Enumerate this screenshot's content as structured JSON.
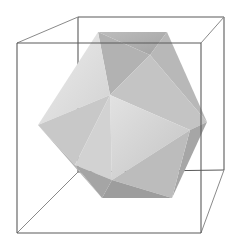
{
  "scene": {
    "title": "",
    "description": "Icosahedron inside a wireframe bounding box",
    "background": "#ffffff",
    "box": {
      "stroke_color": "#5a5a5a",
      "front_face": [
        [
          17,
          43
        ],
        [
          201,
          43
        ],
        [
          201,
          233
        ],
        [
          17,
          233
        ]
      ],
      "back_face_visible_edges": [
        [
          [
            78,
            17
          ],
          [
            224,
            17
          ]
        ],
        [
          [
            224,
            17
          ],
          [
            224,
            170
          ]
        ],
        [
          [
            78,
            17
          ],
          [
            78,
            62
          ]
        ]
      ],
      "connecting_edges": [
        [
          [
            17,
            43
          ],
          [
            78,
            17
          ]
        ],
        [
          [
            201,
            43
          ],
          [
            224,
            17
          ]
        ],
        [
          [
            201,
            233
          ],
          [
            224,
            170
          ]
        ],
        [
          [
            17,
            233
          ],
          [
            78,
            172
          ]
        ]
      ]
    },
    "polyhedron": {
      "type": "icosahedron",
      "vertices": {
        "A": [
          98,
          32
        ],
        "B": [
          167,
          32
        ],
        "C": [
          207,
          122
        ],
        "D": [
          172,
          198
        ],
        "E": [
          102,
          198
        ],
        "F": [
          38,
          125
        ],
        "O": [
          110,
          95
        ],
        "P": [
          150,
          55
        ],
        "Q": [
          190,
          130
        ],
        "R": [
          112,
          180
        ],
        "S": [
          75,
          165
        ]
      },
      "faces": [
        {
          "name": "top-back",
          "points": "A B P",
          "color": "#a9a9a9"
        },
        {
          "name": "top-center",
          "points": "A P O",
          "color": "#b4b4b4"
        },
        {
          "name": "upper-right",
          "points": "B C P",
          "color": "#b9b9b9"
        },
        {
          "name": "right-center",
          "points": "P C Q O",
          "color": "#c2c2c2"
        },
        {
          "name": "upper-left",
          "points": "F A O",
          "color": "#dedede"
        },
        {
          "name": "left",
          "points": "F O S",
          "color": "#c9c9c9"
        },
        {
          "name": "front-center",
          "points": "O Q R",
          "color": "#d6d6d6"
        },
        {
          "name": "right-lower",
          "points": "Q C D",
          "color": "#a8a8a8"
        },
        {
          "name": "lower-right",
          "points": "R Q D",
          "color": "#bdbdbd"
        },
        {
          "name": "lower-center",
          "points": "S O R",
          "color": "#d0d0d0"
        },
        {
          "name": "lower-left",
          "points": "F S E",
          "color": "#b3b3b3"
        },
        {
          "name": "bottom",
          "points": "S R E",
          "color": "#a4a4a4"
        },
        {
          "name": "bottom-right",
          "points": "R D E",
          "color": "#9c9c9c"
        }
      ]
    }
  }
}
